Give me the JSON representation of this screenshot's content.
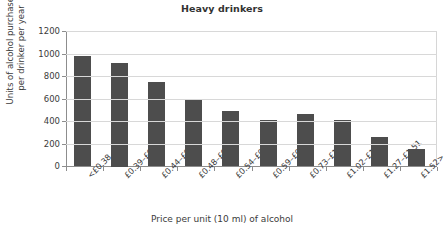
{
  "top_sliver_text": "",
  "chart_data": {
    "type": "bar",
    "title": "Heavy drinkers",
    "xlabel": "Price per unit (10 ml) of alcohol",
    "ylabel_line1": "Units of alcohol purchased",
    "ylabel_line2": "per drinker per year",
    "ylabel": "Units of alcohol purchased per drinker per year",
    "categories": [
      "<£0.38",
      "£0.39–£0.43",
      "£0.44–£0.47",
      "£0.48–£0.53",
      "£0.54–£0.58",
      "£0.59–£0.72",
      "£0.73–£1.01",
      "£1.02–£1.26",
      "£1.27–£1.51",
      "£1.52>"
    ],
    "values": [
      980,
      920,
      750,
      590,
      490,
      410,
      460,
      405,
      255,
      155
    ],
    "ylim": [
      0,
      1200
    ],
    "yticks": [
      0,
      200,
      400,
      600,
      800,
      1000,
      1200
    ],
    "ytick_labels": [
      "0",
      "200",
      "400",
      "600",
      "800",
      "1000",
      "1200"
    ],
    "grid": true,
    "legend": false,
    "bar_color": "#4d4d4d",
    "grid_color": "#d8d8d8",
    "axis_color": "#8d8d8d",
    "text_color": "#3b3b3b"
  }
}
